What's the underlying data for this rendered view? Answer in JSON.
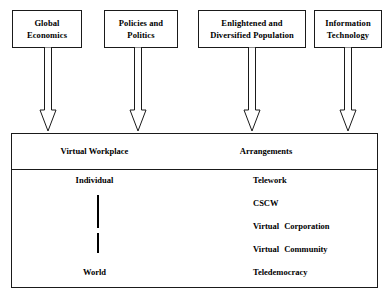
{
  "diagram": {
    "drivers": [
      {
        "id": "global-economics",
        "label": "Global Economics",
        "line1": "Global",
        "line2": "Economics"
      },
      {
        "id": "policies-and-politics",
        "label": "Policies and Politics",
        "line1": "Policies and",
        "line2": "Politics"
      },
      {
        "id": "enlightened-and-diversified-population",
        "label": "Enlightened and Diversified Population",
        "line1": "Enlightened and",
        "line2": "Diversified Population"
      },
      {
        "id": "information-technology",
        "label": "Information Technology",
        "line1": "Information",
        "line2": "Technology"
      }
    ],
    "panel": {
      "header": {
        "left": "Virtual Workplace",
        "right": "Arrangements"
      },
      "scale": {
        "top": "Individual",
        "bottom": "World"
      },
      "arrangements": [
        {
          "id": "telework",
          "label": "Telework",
          "word1": "Telework",
          "word2": ""
        },
        {
          "id": "cscw",
          "label": "CSCW",
          "word1": "CSCW",
          "word2": ""
        },
        {
          "id": "virtual-corporation",
          "label": "Virtual Corporation",
          "word1": "Virtual",
          "word2": "Corporation"
        },
        {
          "id": "virtual-community",
          "label": "Virtual Community",
          "word1": "Virtual",
          "word2": "Community"
        },
        {
          "id": "teledemocracy",
          "label": "Teledemocracy",
          "word1": "Teledemocracy",
          "word2": ""
        }
      ]
    },
    "colors": {
      "stroke": "#1a1a1a",
      "text": "#000000",
      "background": "#ffffff"
    }
  }
}
